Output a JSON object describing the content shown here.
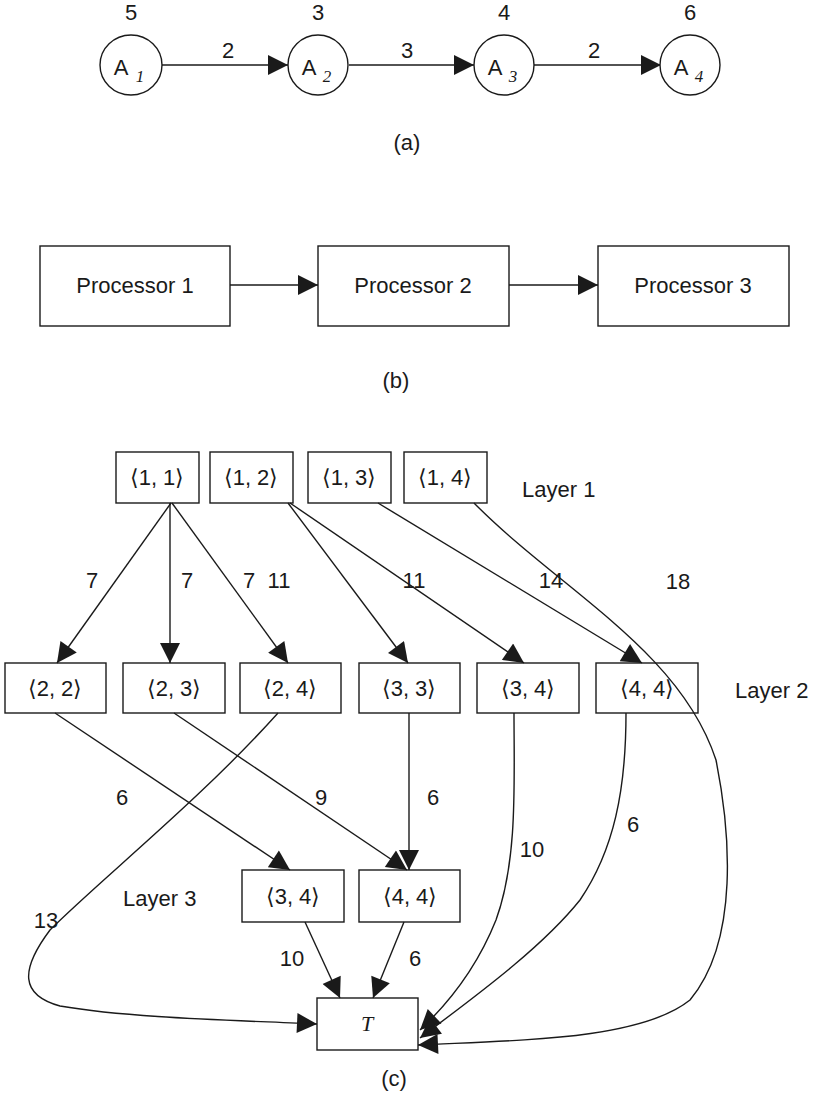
{
  "panel_a": {
    "caption": "(a)",
    "nodes": [
      {
        "id": "A1",
        "label": "A",
        "sub": "1",
        "weight": "5"
      },
      {
        "id": "A2",
        "label": "A",
        "sub": "2",
        "weight": "3"
      },
      {
        "id": "A3",
        "label": "A",
        "sub": "3",
        "weight": "4"
      },
      {
        "id": "A4",
        "label": "A",
        "sub": "4",
        "weight": "6"
      }
    ],
    "edges": [
      {
        "from": "A1",
        "to": "A2",
        "weight": "2"
      },
      {
        "from": "A2",
        "to": "A3",
        "weight": "3"
      },
      {
        "from": "A3",
        "to": "A4",
        "weight": "2"
      }
    ]
  },
  "panel_b": {
    "caption": "(b)",
    "processors": [
      {
        "label": "Processor 1"
      },
      {
        "label": "Processor 2"
      },
      {
        "label": "Processor 3"
      }
    ]
  },
  "panel_c": {
    "caption": "(c)",
    "layer_labels": {
      "layer1": "Layer 1",
      "layer2": "Layer 2",
      "layer3": "Layer 3"
    },
    "layer1": [
      {
        "label": "⟨1, 1⟩"
      },
      {
        "label": "⟨1, 2⟩"
      },
      {
        "label": "⟨1, 3⟩"
      },
      {
        "label": "⟨1, 4⟩"
      }
    ],
    "layer2": [
      {
        "label": "⟨2, 2⟩"
      },
      {
        "label": "⟨2, 3⟩"
      },
      {
        "label": "⟨2, 4⟩"
      },
      {
        "label": "⟨3, 3⟩"
      },
      {
        "label": "⟨3, 4⟩"
      },
      {
        "label": "⟨4, 4⟩"
      }
    ],
    "layer3": [
      {
        "label": "⟨3, 4⟩"
      },
      {
        "label": "⟨4, 4⟩"
      }
    ],
    "terminal": {
      "label": "T"
    },
    "edge_weights": {
      "e11_22": "7",
      "e11_23": "7",
      "e11_24": "7",
      "e12_33": "11",
      "e12_34": "11",
      "e13_44": "14",
      "e14_T": "18",
      "e22_L3_34": "6",
      "e23_L3_44": "9",
      "e33_L3_44": "6",
      "e24_T": "13",
      "e34_T": "10",
      "e44_T": "6",
      "eL3_34_T": "10",
      "eL3_44_T": "6"
    }
  }
}
